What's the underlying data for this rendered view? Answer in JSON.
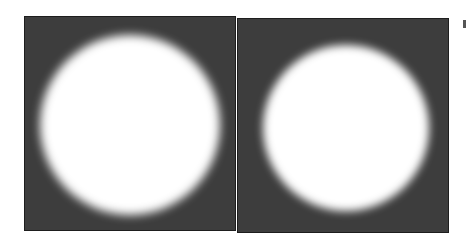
{
  "figure": {
    "background_color": "#ffffff",
    "panel_color": "#3d3d3d",
    "disk_color": "#ffffff",
    "panels": [
      {
        "name": "left",
        "x": 24,
        "y": 16,
        "w": 212,
        "h": 215,
        "disk": {
          "cx": 105,
          "cy": 108,
          "r": 90,
          "blur": 5
        }
      },
      {
        "name": "right",
        "x": 237,
        "y": 18,
        "w": 212,
        "h": 215,
        "disk": {
          "cx": 108,
          "cy": 109,
          "r": 83,
          "blur": 4
        }
      }
    ],
    "edge_mark": {
      "x": 463,
      "y": 20,
      "w": 3,
      "h": 8
    }
  }
}
